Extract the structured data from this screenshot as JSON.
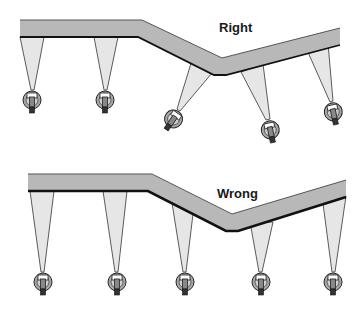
{
  "diagram": {
    "type": "spray-boom-nozzle-orientation",
    "colors": {
      "boom_fill": "#b8b8b8",
      "boom_edge": "#1a1a1a",
      "spray_fill": "#e6e6e6",
      "spray_edge": "#333333",
      "nozzle_fill": "#9a9a9a",
      "background": "#ffffff"
    },
    "panels": [
      {
        "id": "right",
        "label": "Right",
        "description": "Nozzles oriented perpendicular to each boom section",
        "nozzle_count": 5
      },
      {
        "id": "wrong",
        "label": "Wrong",
        "description": "All nozzles pointing straight down regardless of boom angle",
        "nozzle_count": 5
      }
    ]
  }
}
